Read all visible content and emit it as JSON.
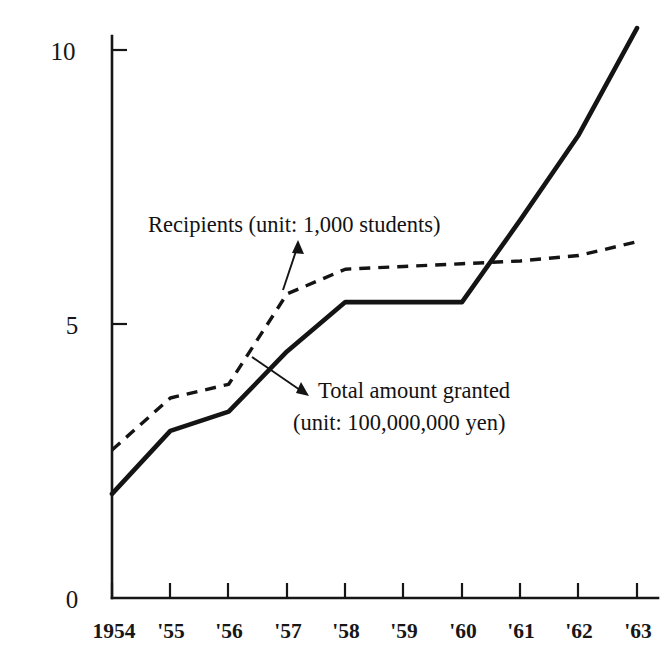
{
  "chart_data": {
    "type": "line",
    "title": "",
    "subtitle": "",
    "xlabel": "",
    "ylabel": "",
    "xlim": [
      1954,
      1963
    ],
    "ylim": [
      0,
      10.9
    ],
    "grid": false,
    "legend_position": "inline-annotations",
    "categories": [
      "1954",
      "'55",
      "'56",
      "'57",
      "'58",
      "'59",
      "'60",
      "'61",
      "'62",
      "'63"
    ],
    "x": [
      1954,
      1955,
      1956,
      1957,
      1958,
      1959,
      1960,
      1961,
      1962,
      1963
    ],
    "y_ticks": [
      0,
      5,
      10
    ],
    "y_tick_labels": [
      "0",
      "5",
      "10"
    ],
    "series": [
      {
        "name": "Total amount granted",
        "unit": "100,000,000 yen",
        "style": "solid",
        "values": [
          1.9,
          3.05,
          3.4,
          4.5,
          5.4,
          5.4,
          5.4,
          6.9,
          8.45,
          10.4
        ]
      },
      {
        "name": "Recipients",
        "unit": "1,000 students",
        "style": "dashed",
        "values": [
          2.7,
          3.65,
          3.9,
          5.55,
          6.0,
          6.05,
          6.1,
          6.15,
          6.25,
          6.5
        ]
      }
    ],
    "annotations": [
      {
        "id": "recipients",
        "text": "Recipients (unit: 1,000 students)",
        "lines": [
          "Recipients (unit: 1,000 students)"
        ]
      },
      {
        "id": "total-amount",
        "text": "Total amount granted (unit: 100,000,000 yen)",
        "lines": [
          "Total amount granted",
          "(unit: 100,000,000 yen)"
        ]
      }
    ]
  },
  "axes": {
    "y": {
      "tick_0": "0",
      "tick_5": "5",
      "tick_10": "10"
    },
    "x": {
      "t0": "1954",
      "t1": "'55",
      "t2": "'56",
      "t3": "'57",
      "t4": "'58",
      "t5": "'59",
      "t6": "'60",
      "t7": "'61",
      "t8": "'62",
      "t9": "'63"
    }
  },
  "annotations": {
    "recipients_label": "Recipients (unit: 1,000 students)",
    "total_label_line1": "Total amount granted",
    "total_label_line2": "(unit: 100,000,000 yen)"
  },
  "colors": {
    "ink": "#141414",
    "background": "#ffffff"
  }
}
